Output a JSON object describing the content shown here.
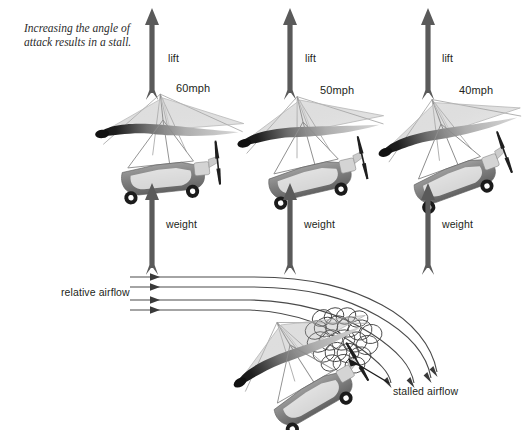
{
  "figure": {
    "caption": "Increasing the angle of attack results in a stall.",
    "background_color": "#ffffff",
    "ink_color": "#231f20",
    "arrow_color": "#555555",
    "wing_dark": "#1c1c1c",
    "wing_light": "#cfcfcf",
    "body_gray": "#8e8e8e",
    "streamline_color": "#4a4a4a"
  },
  "panels": {
    "top": {
      "gliders": [
        {
          "speed_label": "60mph",
          "lift_label": "lift",
          "weight_label": "weight",
          "angle_of_attack_deg": 6,
          "speed_mph": 60
        },
        {
          "speed_label": "50mph",
          "lift_label": "lift",
          "weight_label": "weight",
          "angle_of_attack_deg": 13,
          "speed_mph": 50
        },
        {
          "speed_label": "40mph",
          "lift_label": "lift",
          "weight_label": "weight",
          "angle_of_attack_deg": 20,
          "speed_mph": 40
        }
      ]
    },
    "bottom": {
      "relative_airflow_label": "relative airflow",
      "stalled_airflow_label": "stalled airflow",
      "angle_of_attack_deg": 30,
      "streamline_count": 4,
      "vortex_count": 22
    }
  }
}
